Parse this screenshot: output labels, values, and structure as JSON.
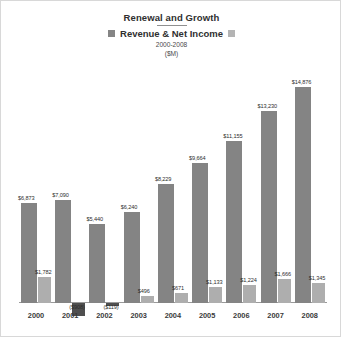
{
  "header": {
    "title": "Renewal and Growth",
    "legend_label": "Revenue & Net Income",
    "period": "2000-2008",
    "units": "($M)"
  },
  "legend": {
    "revenue_name": "Revenue",
    "net_income_name": "Net Income",
    "revenue_color": "#848484",
    "net_income_color": "#aeaeae",
    "negative_color": "#4f4f4f"
  },
  "chart_data": {
    "type": "bar",
    "title": "Renewal and Growth",
    "subtitle": "Revenue & Net Income 2000-2008 ($M)",
    "xlabel": "",
    "ylabel": "($M)",
    "grid": false,
    "legend_position": "top",
    "categories": [
      "2000",
      "2001",
      "2002",
      "2003",
      "2004",
      "2005",
      "2006",
      "2007",
      "2008"
    ],
    "ylim": [
      -1000,
      15500
    ],
    "series": [
      {
        "name": "Revenue",
        "values": [
          6873,
          7090,
          5440,
          6240,
          8229,
          9664,
          11155,
          13230,
          14876
        ],
        "labels": [
          "$6,873",
          "$7,090",
          "$5,440",
          "$6,240",
          "$8,229",
          "$9,664",
          "$11,155",
          "$13,230",
          "$14,876"
        ]
      },
      {
        "name": "Net Income",
        "values": [
          1782,
          -908,
          -119,
          496,
          671,
          1133,
          1224,
          1666,
          1345
        ],
        "labels": [
          "$1,782",
          "($908)",
          "($119)",
          "$496",
          "$671",
          "$1,133",
          "$1,224",
          "$1,666",
          "$1,345"
        ]
      }
    ]
  }
}
